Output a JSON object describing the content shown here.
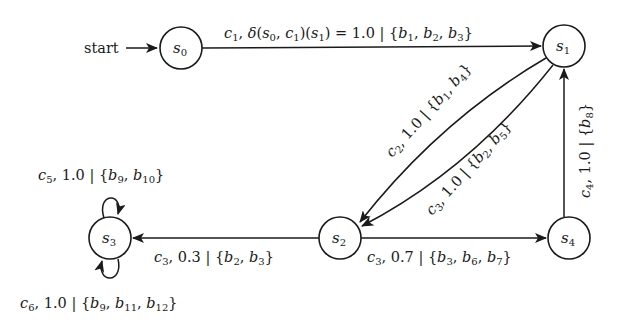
{
  "diagram": {
    "type": "probabilistic-state-machine",
    "start_label": "start",
    "nodes": [
      {
        "id": "s0",
        "name": "s",
        "sub": "0",
        "x": 181,
        "y": 48
      },
      {
        "id": "s1",
        "name": "s",
        "sub": "1",
        "x": 564,
        "y": 46
      },
      {
        "id": "s2",
        "name": "s",
        "sub": "2",
        "x": 340,
        "y": 238
      },
      {
        "id": "s3",
        "name": "s",
        "sub": "3",
        "x": 110,
        "y": 238
      },
      {
        "id": "s4",
        "name": "s",
        "sub": "4",
        "x": 569,
        "y": 238
      }
    ],
    "edges": [
      {
        "from": "s0",
        "to": "s1",
        "label": "c1, δ(s0, c1)(s1) = 1.0 | {b1, b2, b3}"
      },
      {
        "from": "s1",
        "to": "s2",
        "label": "c2, 1.0 | {b1, b4}"
      },
      {
        "from": "s1",
        "to": "s2",
        "label": "c3, 1.0 | {b2, b5}"
      },
      {
        "from": "s4",
        "to": "s1",
        "label": "c4, 1.0 | {b8}"
      },
      {
        "from": "s2",
        "to": "s3",
        "label": "c3, 0.3 | {b2, b3}"
      },
      {
        "from": "s2",
        "to": "s4",
        "label": "c3, 0.7 | {b3, b6, b7}"
      },
      {
        "from": "s3",
        "to": "s3",
        "label": "c5, 1.0 | {b9, b10}"
      },
      {
        "from": "s3",
        "to": "s3",
        "label": "c6, 1.0 | {b9, b11, b12}"
      }
    ]
  }
}
